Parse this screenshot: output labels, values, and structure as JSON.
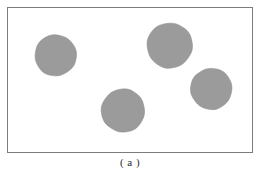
{
  "figure": {
    "caption": "( a )",
    "panel": {
      "background_color": "#ffffff",
      "border_color": "#7c7c7c",
      "x": 7,
      "y": 7,
      "width": 246,
      "height": 146
    },
    "shape_fill_color": "#9b9b9b",
    "shape_edge_color": "#8e8e8e",
    "shape_count": 4,
    "shapes": [
      {
        "name": "blob-top-left",
        "cx": 48,
        "cy": 48,
        "r": 21
      },
      {
        "name": "blob-top-right",
        "cx": 163,
        "cy": 38,
        "r": 23
      },
      {
        "name": "blob-mid-right",
        "cx": 205,
        "cy": 82,
        "r": 21
      },
      {
        "name": "blob-bottom-center",
        "cx": 116,
        "cy": 104,
        "r": 22
      }
    ]
  }
}
